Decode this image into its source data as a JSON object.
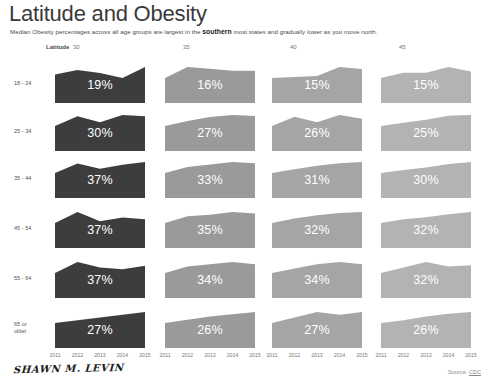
{
  "header": {
    "title": "Latitude and Obesity",
    "subtitle_before": "Median Obesity percentages across all age groups are largest in the ",
    "subtitle_emphasis": "southern",
    "subtitle_after": " most states and gradually lower as you move north."
  },
  "axes": {
    "latitude_label": "Latitude",
    "latitude_ticks": [
      "30",
      "35",
      "40",
      "45"
    ],
    "year_ticks": [
      "2011",
      "2012",
      "2013",
      "2014",
      "2015"
    ]
  },
  "footer": {
    "signature": "SHAWN M. LEVIN",
    "source_prefix": "Source: ",
    "source_name": "CDC"
  },
  "colors": {
    "latitude_30": "#3d3d3d",
    "latitude_35": "#9a9a9a",
    "latitude_40": "#a5a5a5",
    "latitude_45": "#b3b3b3",
    "value_text": "#ffffff",
    "background": "#ffffff"
  },
  "chart_data": {
    "type": "area",
    "title": "Latitude and Obesity",
    "subtitle": "Median Obesity percentages across all age groups are largest in the southern most states and gradually lower as you move north.",
    "xlabel": "",
    "ylabel": "",
    "x": [
      "2011",
      "2012",
      "2013",
      "2014",
      "2015"
    ],
    "col_variable": "Latitude",
    "col_categories": [
      "30",
      "35",
      "40",
      "45"
    ],
    "row_variable": "Age group",
    "row_categories": [
      "18 - 24",
      "25 - 34",
      "35 - 44",
      "45 - 54",
      "55 - 64",
      "65 or older"
    ],
    "legend": "none",
    "grid": false,
    "cells": [
      {
        "row": "18 - 24",
        "col": "30",
        "label": "19%",
        "median": 19,
        "color": "#3d3d3d",
        "values": [
          19.0,
          20.2,
          19.4,
          18.1,
          21.0
        ]
      },
      {
        "row": "18 - 24",
        "col": "35",
        "label": "16%",
        "median": 16,
        "color": "#9a9a9a",
        "values": [
          15.4,
          16.6,
          16.4,
          16.2,
          16.2
        ]
      },
      {
        "row": "18 - 24",
        "col": "40",
        "label": "15%",
        "median": 15,
        "color": "#a5a5a5",
        "values": [
          14.4,
          14.6,
          14.8,
          16.6,
          16.2
        ]
      },
      {
        "row": "18 - 24",
        "col": "45",
        "label": "15%",
        "median": 15,
        "color": "#b3b3b3",
        "values": [
          13.6,
          15.0,
          15.0,
          16.6,
          15.4
        ]
      },
      {
        "row": "25 - 34",
        "col": "30",
        "label": "30%",
        "median": 30,
        "color": "#3d3d3d",
        "values": [
          29.0,
          30.6,
          29.6,
          30.8,
          30.6
        ]
      },
      {
        "row": "25 - 34",
        "col": "35",
        "label": "27%",
        "median": 27,
        "color": "#9a9a9a",
        "values": [
          25.6,
          26.6,
          27.4,
          27.8,
          27.6
        ]
      },
      {
        "row": "25 - 34",
        "col": "40",
        "label": "26%",
        "median": 26,
        "color": "#a5a5a5",
        "values": [
          25.4,
          26.4,
          25.8,
          26.6,
          26.2
        ]
      },
      {
        "row": "25 - 34",
        "col": "45",
        "label": "25%",
        "median": 25,
        "color": "#b3b3b3",
        "values": [
          23.6,
          24.4,
          25.2,
          26.2,
          26.4
        ]
      },
      {
        "row": "35 - 44",
        "col": "30",
        "label": "37%",
        "median": 37,
        "color": "#3d3d3d",
        "values": [
          36.0,
          37.4,
          36.6,
          37.2,
          37.6
        ]
      },
      {
        "row": "35 - 44",
        "col": "35",
        "label": "33%",
        "median": 33,
        "color": "#9a9a9a",
        "values": [
          32.0,
          33.0,
          33.4,
          33.8,
          33.6
        ]
      },
      {
        "row": "35 - 44",
        "col": "40",
        "label": "31%",
        "median": 31,
        "color": "#a5a5a5",
        "values": [
          30.2,
          30.8,
          31.4,
          31.8,
          32.0
        ]
      },
      {
        "row": "35 - 44",
        "col": "45",
        "label": "30%",
        "median": 30,
        "color": "#b3b3b3",
        "values": [
          28.0,
          29.2,
          30.2,
          31.6,
          32.4
        ]
      },
      {
        "row": "45 - 54",
        "col": "30",
        "label": "37%",
        "median": 37,
        "color": "#3d3d3d",
        "values": [
          36.6,
          37.8,
          36.8,
          37.2,
          37.0
        ]
      },
      {
        "row": "45 - 54",
        "col": "35",
        "label": "35%",
        "median": 35,
        "color": "#9a9a9a",
        "values": [
          34.0,
          35.0,
          35.2,
          35.6,
          35.4
        ]
      },
      {
        "row": "45 - 54",
        "col": "40",
        "label": "32%",
        "median": 32,
        "color": "#a5a5a5",
        "values": [
          31.2,
          32.0,
          32.6,
          33.0,
          33.2
        ]
      },
      {
        "row": "45 - 54",
        "col": "45",
        "label": "32%",
        "median": 32,
        "color": "#b3b3b3",
        "values": [
          30.6,
          31.6,
          32.2,
          33.0,
          33.6
        ]
      },
      {
        "row": "55 - 64",
        "col": "30",
        "label": "37%",
        "median": 37,
        "color": "#3d3d3d",
        "values": [
          36.4,
          37.6,
          37.0,
          36.8,
          37.2
        ]
      },
      {
        "row": "55 - 64",
        "col": "35",
        "label": "34%",
        "median": 34,
        "color": "#9a9a9a",
        "values": [
          33.6,
          34.2,
          34.4,
          34.6,
          34.4
        ]
      },
      {
        "row": "55 - 64",
        "col": "40",
        "label": "34%",
        "median": 34,
        "color": "#a5a5a5",
        "values": [
          33.4,
          33.8,
          34.2,
          34.4,
          34.2
        ]
      },
      {
        "row": "55 - 64",
        "col": "45",
        "label": "32%",
        "median": 32,
        "color": "#b3b3b3",
        "values": [
          31.4,
          32.4,
          33.4,
          32.6,
          32.8
        ]
      },
      {
        "row": "65 or older",
        "col": "30",
        "label": "27%",
        "median": 27,
        "color": "#3d3d3d",
        "values": [
          25.4,
          26.2,
          27.0,
          27.8,
          28.6
        ]
      },
      {
        "row": "65 or older",
        "col": "35",
        "label": "26%",
        "median": 26,
        "color": "#9a9a9a",
        "values": [
          24.8,
          25.4,
          26.0,
          26.4,
          26.8
        ]
      },
      {
        "row": "65 or older",
        "col": "40",
        "label": "27%",
        "median": 27,
        "color": "#a5a5a5",
        "values": [
          25.6,
          26.4,
          27.2,
          26.8,
          27.2
        ]
      },
      {
        "row": "65 or older",
        "col": "45",
        "label": "26%",
        "median": 26,
        "color": "#b3b3b3",
        "values": [
          24.6,
          25.2,
          26.0,
          26.6,
          27.0
        ]
      }
    ]
  }
}
